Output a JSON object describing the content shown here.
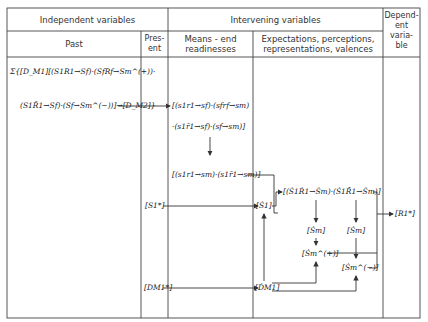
{
  "header": {
    "independent": "Independent variables",
    "intervening": "Intervening variables",
    "dependent": "Depend-\nent\nvaria-\nble",
    "past": "Past",
    "present": "Pres-\nent",
    "means_end": "Means - end\nreadinesses",
    "expectations": "Expectations, perceptions,\nrepresentations, valences"
  },
  "past": {
    "line1": "Σ{[D_M1][(S1R1→Sf)·(SfRf→Sm^(+))·",
    "line2": "(S1R̄1→Sf)·(Sf→Sm^(−))]→[D_M2]}"
  },
  "present": {
    "s1_star": "[S1*]",
    "dm1_star": "[DM1*]"
  },
  "means_end": {
    "box1_line1": "[(s1r1→sf)·(sfrf→sm)",
    "box1_line2": "·(s1r̄1→sf)·(sf→sm)]",
    "box2": "[(s1r1→sm)·(s1r̄1→sm)]"
  },
  "expectations": {
    "s1_dot": "[Ṡ1]",
    "compound": "[(Ṡ1Ṙ1→Ṡm)·(Ṡ1R̄̇1→Ṡm)]",
    "sm_left": "[Ṡm]",
    "sm_right": "[Ṡm]",
    "sm_plus": "[Ṡm^(+)]",
    "sm_minus": "[Ṡm^(−)]",
    "dm1_dot": "[ḊM1]"
  },
  "dependent": {
    "r1_star": "[R1*]"
  },
  "colors": {
    "line": "#3a3a3a",
    "text": "#222222",
    "background": "#ffffff"
  }
}
